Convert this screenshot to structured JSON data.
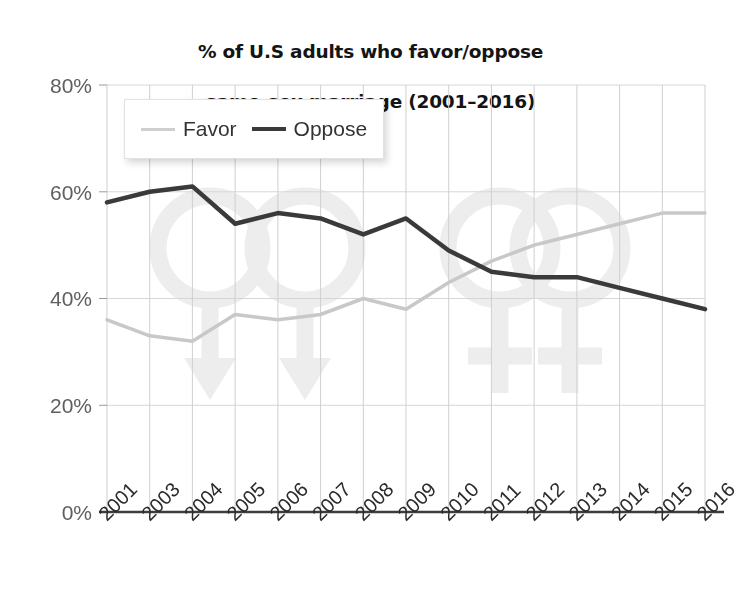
{
  "chart_data": {
    "type": "line",
    "title": "% of U.S adults who favor/oppose\nsame-sex marriage (2001–2016)",
    "title_line1": "% of U.S adults who favor/oppose",
    "title_line2": "same-sex marriage (2001–2016)",
    "xlabel": "",
    "ylabel": "",
    "categories": [
      "2001",
      "2003",
      "2004",
      "2005",
      "2006",
      "2007",
      "2008",
      "2009",
      "2010",
      "2011",
      "2012",
      "2013",
      "2014",
      "2015",
      "2016"
    ],
    "series": [
      {
        "name": "Favor",
        "color": "#c8c8c8",
        "values": [
          36,
          33,
          32,
          37,
          36,
          37,
          40,
          38,
          43,
          47,
          50,
          52,
          54,
          56,
          56
        ]
      },
      {
        "name": "Oppose",
        "color": "#3a3a3a",
        "values": [
          58,
          60,
          61,
          54,
          56,
          55,
          52,
          55,
          49,
          45,
          44,
          44,
          42,
          40,
          38
        ]
      }
    ],
    "ylim": [
      0,
      80
    ],
    "yticks": [
      0,
      20,
      40,
      60,
      80
    ],
    "ytick_labels": [
      "0%",
      "20%",
      "40%",
      "60%",
      "80%"
    ],
    "grid": true,
    "legend_position": "top-left",
    "background_watermark": "gender-symbols"
  },
  "legend": {
    "items": [
      {
        "label": "Favor"
      },
      {
        "label": "Oppose"
      }
    ]
  },
  "colors": {
    "favor": "#c8c8c8",
    "oppose": "#3a3a3a",
    "grid": "#d6d6d6",
    "axis": "#4a4a4a",
    "text": "#141414",
    "tick_text": "#5f5f5f"
  }
}
